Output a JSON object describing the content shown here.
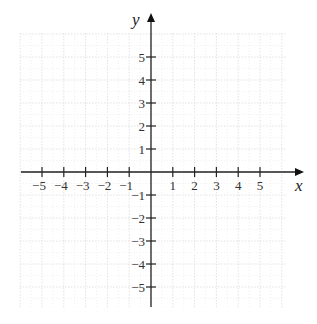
{
  "chart_data": {
    "type": "scatter",
    "title": "",
    "xlabel": "x",
    "ylabel": "y",
    "xlim": [
      -6,
      6
    ],
    "ylim": [
      -6,
      6
    ],
    "grid": true,
    "x_ticks": [
      -5,
      -4,
      -3,
      -2,
      -1,
      1,
      2,
      3,
      4,
      5
    ],
    "y_ticks": [
      -5,
      -4,
      -3,
      -2,
      -1,
      1,
      2,
      3,
      4,
      5
    ],
    "x_tick_labels": [
      "−5",
      "−4",
      "−3",
      "−2",
      "−1",
      "1",
      "2",
      "3",
      "4",
      "5"
    ],
    "y_tick_labels": [
      "−5",
      "−4",
      "−3",
      "−2",
      "−1",
      "1",
      "2",
      "3",
      "4",
      "5"
    ],
    "points": []
  },
  "axes": {
    "x_label": "x",
    "y_label": "y"
  },
  "colors": {
    "axis": "#222222",
    "grid": "#e2e2e2",
    "text": "#333333"
  }
}
